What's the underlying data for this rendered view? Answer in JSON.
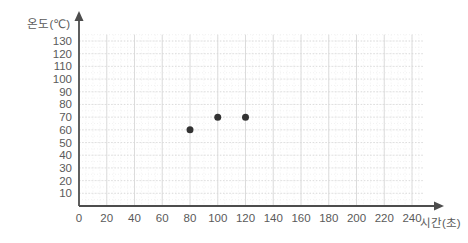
{
  "chart_data": {
    "type": "scatter",
    "title": "",
    "subtitle": "",
    "xlabel": "시간(초)",
    "ylabel": "온도(℃)",
    "xlim": [
      0,
      250
    ],
    "ylim": [
      0,
      135
    ],
    "x_ticks": [
      0,
      20,
      40,
      60,
      80,
      100,
      120,
      140,
      160,
      180,
      200,
      220,
      240
    ],
    "y_ticks": [
      10,
      20,
      30,
      40,
      50,
      60,
      70,
      80,
      90,
      100,
      110,
      120,
      130
    ],
    "x_tick_labels": [
      "0",
      "20",
      "40",
      "60",
      "80",
      "100",
      "120",
      "140",
      "160",
      "180",
      "200",
      "220",
      "240"
    ],
    "y_tick_labels": [
      "10",
      "20",
      "30",
      "40",
      "50",
      "60",
      "70",
      "80",
      "90",
      "100",
      "110",
      "120",
      "130"
    ],
    "grid": true,
    "grid_color": "#d8d8d8",
    "minor_grid_color": "#ededed",
    "legend": false,
    "legend_position": "none",
    "axis_color": "#4d4d4d",
    "marker_color": "#333333",
    "marker_size": 7,
    "series": [
      {
        "name": "온도",
        "points": [
          {
            "x": 80,
            "y": 60
          },
          {
            "x": 100,
            "y": 70
          },
          {
            "x": 120,
            "y": 70
          }
        ]
      }
    ],
    "annotations": []
  }
}
